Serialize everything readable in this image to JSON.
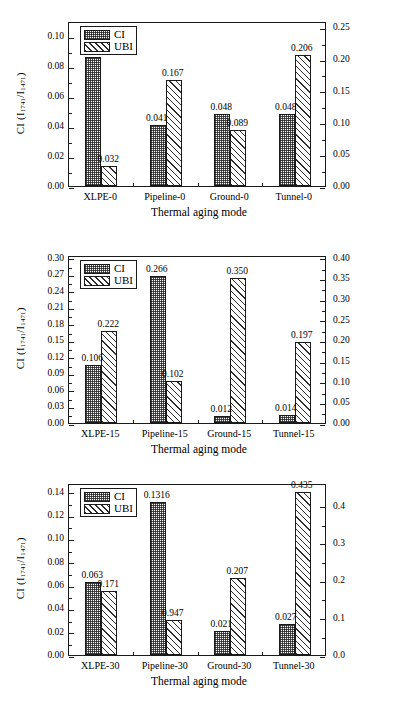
{
  "figure": {
    "panel_count": 3,
    "series_names": [
      "CI",
      "UBI"
    ],
    "x_axis_title": "Thermal aging mode",
    "left_axis_title_parts": {
      "name": "CI",
      "num": "1741",
      "den": "1471"
    },
    "right_axis_title_parts": {
      "name": "UBI",
      "num": "1635",
      "den": "1471"
    },
    "legend": {
      "ci_label": "CI",
      "ubi_label": "UBI",
      "ci_swatch": "dotted-grid-pattern",
      "ubi_swatch": "diagonal-hatch-pattern"
    }
  },
  "chart_data": [
    {
      "type": "bar",
      "title": "",
      "panel": "a",
      "categories": [
        "XLPE-0",
        "Pipeline-0",
        "Ground-0",
        "Tunnel-0"
      ],
      "series": [
        {
          "name": "CI",
          "axis": "left",
          "values": [
            0.086,
            0.041,
            0.048,
            0.048
          ],
          "labels": [
            "0.086",
            "0.041",
            "0.048",
            "0.048"
          ]
        },
        {
          "name": "UBI",
          "axis": "right",
          "values": [
            0.032,
            0.167,
            0.089,
            0.206
          ],
          "labels": [
            "0.032",
            "0.167",
            "0.089",
            "0.206"
          ]
        }
      ],
      "xlabel": "Thermal aging mode",
      "ylabel_left": "CI (I1741/I1471)",
      "ylabel_right": "UBI (I1635/I1471)",
      "ylim_left": [
        0.0,
        0.11
      ],
      "ylim_right": [
        0.0,
        0.26
      ],
      "yticks_left": [
        "0.00",
        "0.02",
        "0.04",
        "0.06",
        "0.08",
        "0.10"
      ],
      "ytickvals_left": [
        0.0,
        0.02,
        0.04,
        0.06,
        0.08,
        0.1
      ],
      "yticks_right": [
        "0.00",
        "0.05",
        "0.10",
        "0.15",
        "0.20",
        "0.25"
      ],
      "ytickvals_right": [
        0.0,
        0.05,
        0.1,
        0.15,
        0.2,
        0.25
      ],
      "grid": false,
      "legend_position": "top-left"
    },
    {
      "type": "bar",
      "title": "",
      "panel": "b",
      "categories": [
        "XLPE-15",
        "Pipeline-15",
        "Ground-15",
        "Tunnel-15"
      ],
      "series": [
        {
          "name": "CI",
          "axis": "left",
          "values": [
            0.106,
            0.266,
            0.012,
            0.014
          ],
          "labels": [
            "0.106",
            "0.266",
            "0.012",
            "0.014"
          ]
        },
        {
          "name": "UBI",
          "axis": "right",
          "values": [
            0.222,
            0.102,
            0.35,
            0.197
          ],
          "labels": [
            "0.222",
            "0.102",
            "0.350",
            "0.197"
          ]
        }
      ],
      "xlabel": "Thermal aging mode",
      "ylabel_left": "CI (I1741/I1471)",
      "ylabel_right": "UBI (I1635/I1471)",
      "ylim_left": [
        0.0,
        0.305
      ],
      "ylim_right": [
        0.0,
        0.4067
      ],
      "yticks_left": [
        "0.00",
        "0.03",
        "0.06",
        "0.09",
        "0.12",
        "0.15",
        "0.18",
        "0.21",
        "0.24",
        "0.27",
        "0.30"
      ],
      "ytickvals_left": [
        0.0,
        0.03,
        0.06,
        0.09,
        0.12,
        0.15,
        0.18,
        0.21,
        0.24,
        0.27,
        0.3
      ],
      "yticks_right": [
        "0.00",
        "0.05",
        "0.10",
        "0.15",
        "0.20",
        "0.25",
        "0.30",
        "0.35",
        "0.40"
      ],
      "ytickvals_right": [
        0.0,
        0.05,
        0.1,
        0.15,
        0.2,
        0.25,
        0.3,
        0.35,
        0.4
      ],
      "grid": false,
      "legend_position": "top-left"
    },
    {
      "type": "bar",
      "title": "",
      "panel": "c",
      "categories": [
        "XLPE-30",
        "Pipeline-30",
        "Ground-30",
        "Tunnel-30"
      ],
      "series": [
        {
          "name": "CI",
          "axis": "left",
          "values": [
            0.063,
            0.1316,
            0.021,
            0.027
          ],
          "labels": [
            "0.063",
            "0.1316",
            "0.021",
            "0.027"
          ]
        },
        {
          "name": "UBI",
          "axis": "right",
          "values": [
            0.171,
            0.0947,
            0.207,
            0.435
          ],
          "labels": [
            "0.171",
            "0.947",
            "0.207",
            "0.435"
          ]
        }
      ],
      "xlabel": "Thermal aging mode",
      "ylabel_left": "CI (I1741/I1471)",
      "ylabel_right": "UBI (I1635/I1471)",
      "ylim_left": [
        0.0,
        0.1475
      ],
      "ylim_right": [
        0.0,
        0.4603
      ],
      "yticks_left": [
        "0.00",
        "0.02",
        "0.04",
        "0.06",
        "0.08",
        "0.10",
        "0.12",
        "0.14"
      ],
      "ytickvals_left": [
        0.0,
        0.02,
        0.04,
        0.06,
        0.08,
        0.1,
        0.12,
        0.14
      ],
      "yticks_right": [
        "0.0",
        "0.1",
        "0.2",
        "0.3",
        "0.4"
      ],
      "ytickvals_right": [
        0.0,
        0.1,
        0.2,
        0.3,
        0.4
      ],
      "grid": false,
      "legend_position": "top-left"
    }
  ]
}
